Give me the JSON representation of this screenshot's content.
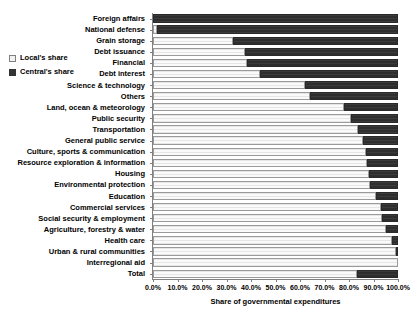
{
  "chart_data": {
    "type": "bar",
    "orientation": "horizontal",
    "stacked": true,
    "stack_mode": "percent",
    "title": "",
    "xlabel": "Share of governmental expenditures",
    "ylabel": "",
    "xlim": [
      0,
      100
    ],
    "xtick_labels": [
      "0.0%",
      "10.0%",
      "20.0%",
      "30.0%",
      "40.0%",
      "50.0%",
      "60.0%",
      "70.0%",
      "80.0%",
      "90.0%",
      "100.0%"
    ],
    "xtick_values": [
      0,
      10,
      20,
      30,
      40,
      50,
      60,
      70,
      80,
      90,
      100
    ],
    "grid": false,
    "legend_position": "left",
    "categories": [
      "Foreign affairs",
      "National defense",
      "Grain storage",
      "Debt issuance",
      "Financial",
      "Debt interest",
      "Science & technology",
      "Others",
      "Land, ocean & meteorology",
      "Public security",
      "Transportation",
      "General public service",
      "Culture, sports & communication",
      "Resource exploration & information",
      "Housing",
      "Environmental protection",
      "Education",
      "Commercial services",
      "Social security & employment",
      "Agriculture, forestry & water",
      "Health care",
      "Urban & rural communities",
      "Interregional aid",
      "Total"
    ],
    "series": [
      {
        "name": "Local's share",
        "color": "#f2f2f2",
        "values": [
          0.0,
          1.5,
          32.6,
          37.6,
          38.4,
          43.7,
          62.0,
          64.0,
          78.0,
          80.8,
          83.7,
          85.7,
          87.0,
          87.3,
          88.2,
          88.6,
          91.0,
          92.9,
          93.3,
          95.2,
          97.6,
          99.8,
          100.0,
          83.3
        ]
      },
      {
        "name": "Central's share",
        "color": "#333333",
        "values": [
          100.0,
          98.5,
          67.4,
          62.4,
          61.6,
          56.3,
          38.0,
          36.0,
          22.0,
          19.2,
          16.3,
          14.3,
          13.0,
          12.7,
          11.8,
          11.4,
          9.0,
          7.1,
          6.7,
          4.8,
          2.4,
          0.2,
          0.0,
          16.7
        ]
      }
    ]
  },
  "legend": {
    "items": [
      {
        "label": "Local's share",
        "key": "local"
      },
      {
        "label": "Central's share",
        "key": "central"
      }
    ]
  }
}
